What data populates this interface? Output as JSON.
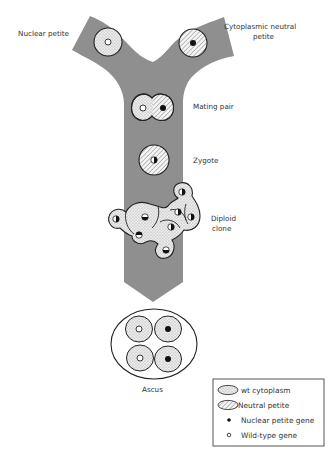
{
  "labels": {
    "nuclear_petite": "Nuclear petite",
    "cytoplasmic_neutral_petite_line1": "Cytoplasmic neutral",
    "cytoplasmic_neutral_petite_line2": "petite",
    "mating_pair": "Mating pair",
    "zygote": "Zygote",
    "diploid_clone_line1": "Diploid",
    "diploid_clone_line2": "clone",
    "ascus": "Ascus"
  },
  "legend": {
    "items": [
      {
        "symbol": "stippled-ellipse",
        "label": "wt cytoplasm"
      },
      {
        "symbol": "hatched-ellipse",
        "label": "Neutral petite"
      },
      {
        "symbol": "filled-dot",
        "label": "Nuclear petite gene"
      },
      {
        "symbol": "open-dot",
        "label": "Wild-type gene"
      }
    ]
  },
  "colors": {
    "band": "#8f8f8f",
    "cell_fill": "#e4e4e4",
    "outline": "#222222",
    "text": "#333333"
  }
}
